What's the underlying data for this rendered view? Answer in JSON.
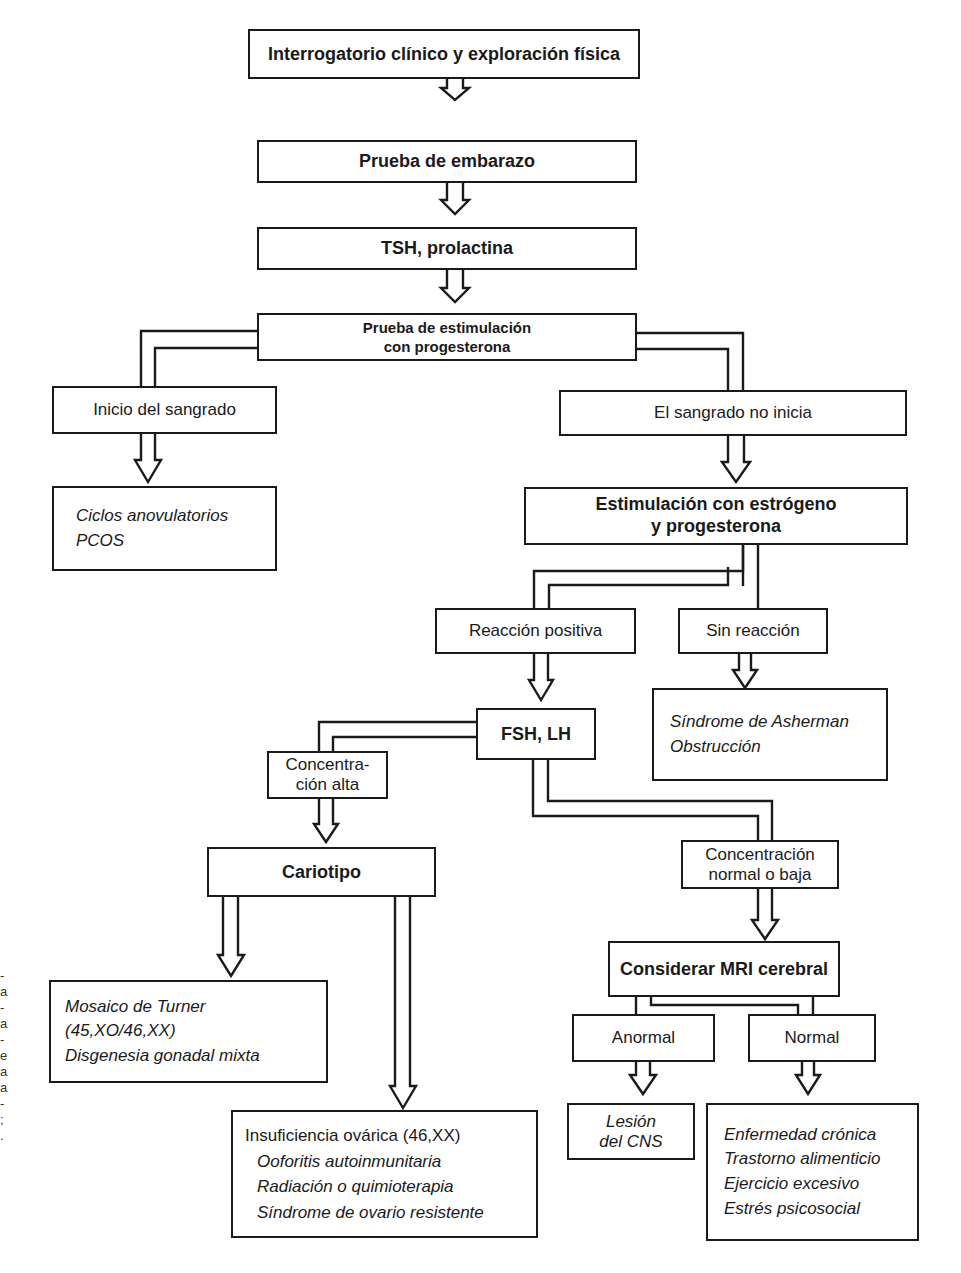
{
  "diagram": {
    "nodes": {
      "history": "Interrogatorio clínico y exploración física",
      "pregnancy_test": "Prueba de embarazo",
      "tsh_prolactin": "TSH, prolactina",
      "progesterone_test_l1": "Prueba de estimulación",
      "progesterone_test_l2": "con progesterona",
      "bleeding_starts": "Inicio del sangrado",
      "bleeding_not": "El sangrado no inicia",
      "anovulatory": [
        "Ciclos anovulatorios",
        "PCOS"
      ],
      "estrogen_progesterone_l1": "Estimulación con estrógeno",
      "estrogen_progesterone_l2": "y progesterona",
      "positive_reaction": "Reacción positiva",
      "no_reaction": "Sin reacción",
      "asherman": [
        "Síndrome de Asherman",
        "Obstrucción"
      ],
      "fsh_lh": "FSH, LH",
      "high_conc_l1": "Concentra-",
      "high_conc_l2": "ción alta",
      "normal_low_l1": "Concentración",
      "normal_low_l2": "normal o baja",
      "karyotype": "Cariotipo",
      "turner": [
        "Mosaico de Turner",
        "(45,XO/46,XX)",
        "Disgenesia gonadal mixta"
      ],
      "ovarian_failure_head": "Insuficiencia ovárica (46,XX)",
      "ovarian_failure_items": [
        "Ooforitis autoinmunitaria",
        "Radiación o quimioterapia",
        "Síndrome de ovario resistente"
      ],
      "mri": "Considerar MRI cerebral",
      "abnormal": "Anormal",
      "normal": "Normal",
      "cns_lesion_l1": "Lesión",
      "cns_lesion_l2": "del CNS",
      "functional": [
        "Enfermedad crónica",
        "Trastorno alimenticio",
        "Ejercicio excesivo",
        "Estrés psicosocial"
      ]
    },
    "edge_fragments": [
      "-",
      "a",
      "-",
      "a",
      "-",
      "e",
      "a",
      "a",
      "-",
      ";",
      "."
    ],
    "colors": {
      "stroke": "#1a1a1a",
      "background": "#ffffff"
    }
  }
}
